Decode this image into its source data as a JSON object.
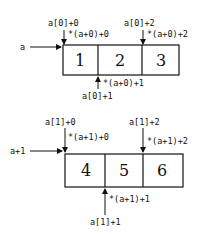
{
  "diagrams": [
    {
      "pointer_label": "a",
      "cells": [
        "1",
        "2",
        "3"
      ],
      "top_left_label": "a[0]+0",
      "top_left_deref": "*(a+0)+0",
      "top_right_label": "a[0]+2",
      "top_right_deref": "*(a+0)+2",
      "bottom_mid_deref": "*(a+0)+1",
      "bottom_mid_label": "a[0]+1"
    },
    {
      "pointer_label": "a+1",
      "cells": [
        "4",
        "5",
        "6"
      ],
      "top_left_label": "a[1]+0",
      "top_left_deref": "*(a+1)+0",
      "top_right_label": "a[1]+2",
      "top_right_deref": "*(a+1)+2",
      "bottom_mid_deref": "*(a+1)+1",
      "bottom_mid_label": "a[1]+1"
    }
  ],
  "colors": {
    "stroke": "#111111",
    "background": "#ffffff"
  }
}
